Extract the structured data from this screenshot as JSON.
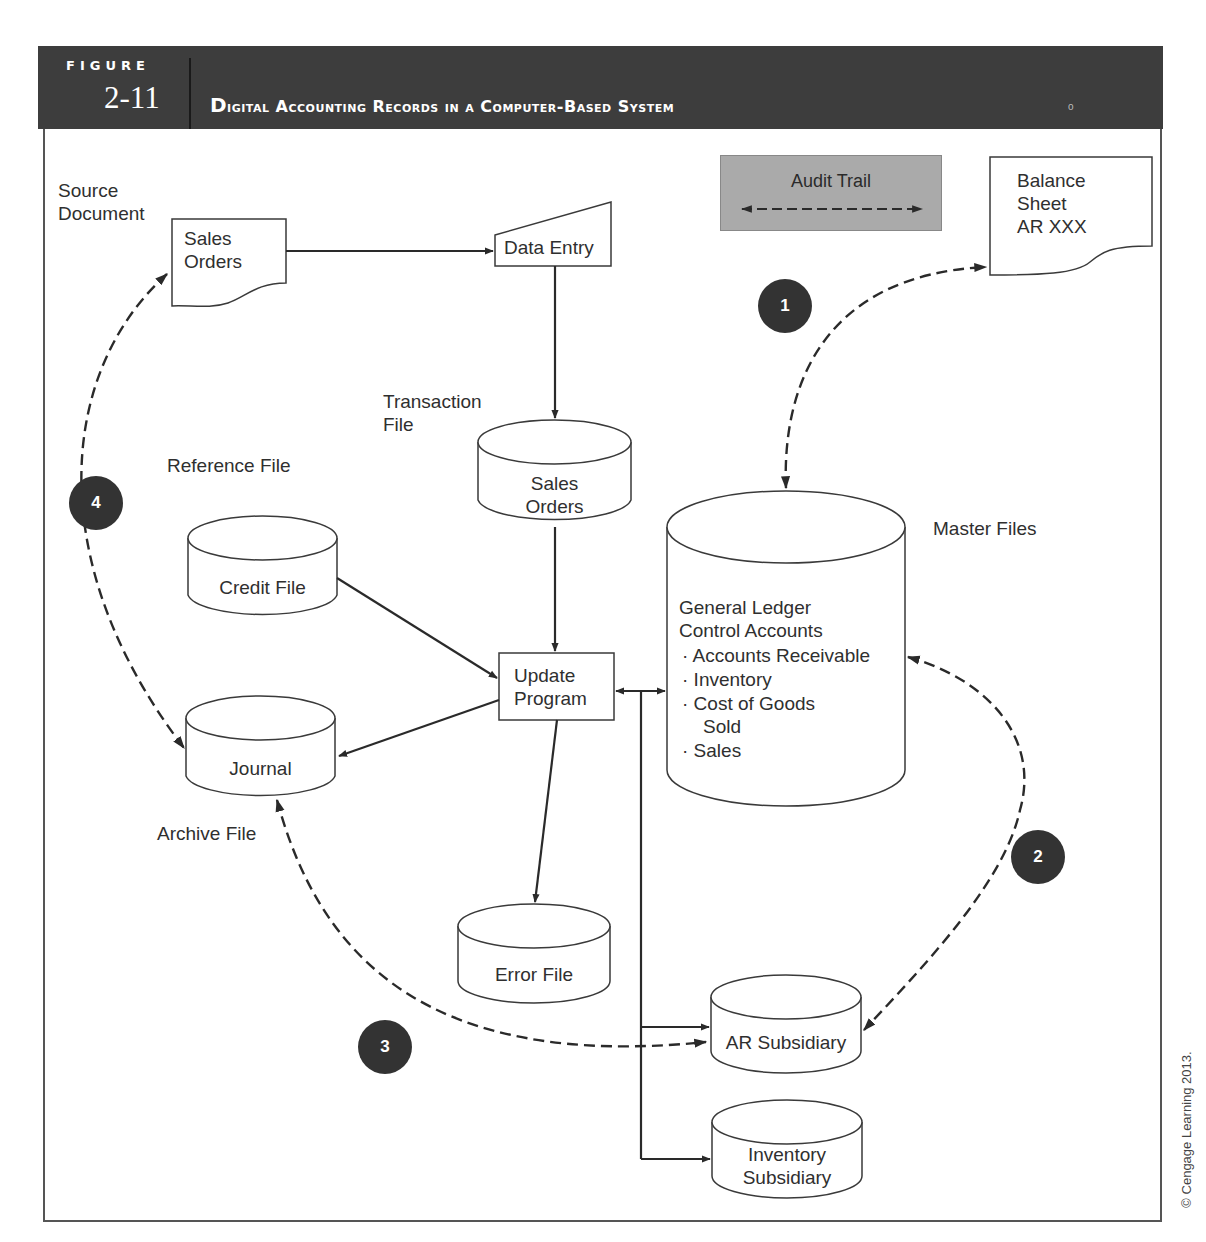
{
  "header": {
    "figure_word": "FIGURE",
    "figure_number": "2-11",
    "title": "Digital Accounting Records in a Computer-Based System",
    "corner_mark": "o"
  },
  "legend": {
    "title": "Audit Trail",
    "symbol": "dashed-double-arrow"
  },
  "labels": {
    "source_document": "Source\nDocument",
    "transaction_file": "Transaction\nFile",
    "reference_file": "Reference File",
    "master_files": "Master Files",
    "archive_file": "Archive File"
  },
  "nodes": {
    "sales_orders_doc": "Sales\nOrders",
    "data_entry": "Data Entry",
    "balance_sheet": "Balance\nSheet\nAR XXX",
    "sales_orders_file": "Sales\nOrders",
    "credit_file": "Credit File",
    "update_program": "Update\nProgram",
    "journal": "Journal",
    "error_file": "Error File",
    "ar_subsidiary": "AR Subsidiary",
    "inventory_subsidiary": "Inventory\nSubsidiary",
    "general_ledger": {
      "heading": "General Ledger\nControl Accounts",
      "items": [
        "Accounts Receivable",
        "Inventory",
        "Cost of Goods\n    Sold",
        "Sales"
      ]
    }
  },
  "badges": [
    "1",
    "2",
    "3",
    "4"
  ],
  "copyright": "© Cengage Learning 2013."
}
